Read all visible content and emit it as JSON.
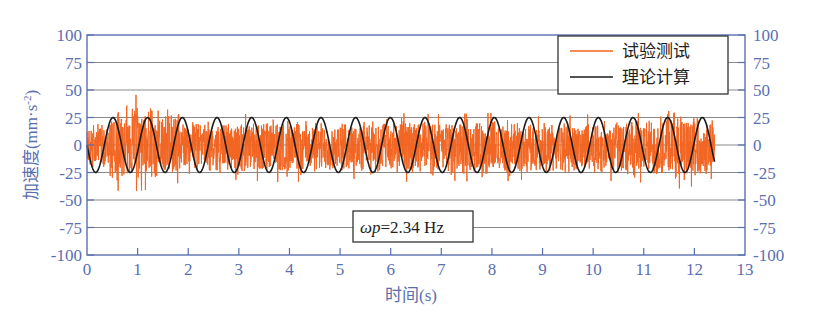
{
  "chart_data": {
    "type": "line",
    "title": "",
    "xlabel": "时间(s)",
    "ylabel": "加速度(mm·s⁻²)",
    "ylabel_parts": {
      "main": "加速度(mm·s",
      "sup": "-2",
      "close": ")"
    },
    "xlim": [
      0,
      13
    ],
    "ylim": [
      -100,
      100
    ],
    "x_ticks": [
      0,
      1,
      2,
      3,
      4,
      5,
      6,
      7,
      8,
      9,
      10,
      11,
      12,
      13
    ],
    "y_ticks": [
      100,
      75,
      50,
      25,
      0,
      -25,
      -50,
      -75,
      -100
    ],
    "y_ticks_right": [
      100,
      75,
      50,
      25,
      0,
      -25,
      -50,
      -75,
      -100
    ],
    "grid": {
      "horizontal": true,
      "vertical": false
    },
    "legend": {
      "position": "upper-right",
      "entries": [
        {
          "label": "试验测试",
          "color": "#f26522"
        },
        {
          "label": "理论计算",
          "color": "#1a1a1a"
        }
      ]
    },
    "annotation": {
      "prefix": "ωp",
      "text": "=2.34 Hz"
    },
    "series": [
      {
        "name": "试验测试",
        "color": "#f26522",
        "kind": "noisy-measured",
        "t_start": 0,
        "t_end": 12.4,
        "envelope": {
          "t": [
            0,
            0.3,
            0.6,
            1.0,
            1.5,
            1.8,
            2.2,
            3.0,
            4.0,
            5.0,
            6.0,
            7.0,
            8.0,
            9.0,
            10.0,
            11.0,
            11.8,
            12.4
          ],
          "upper": [
            18,
            22,
            38,
            40,
            35,
            30,
            22,
            24,
            25,
            22,
            25,
            24,
            25,
            22,
            24,
            25,
            35,
            24
          ],
          "lower": [
            -22,
            -26,
            -36,
            -36,
            -34,
            -30,
            -24,
            -28,
            -30,
            -26,
            -30,
            -28,
            -30,
            -26,
            -28,
            -30,
            -35,
            -26
          ]
        }
      },
      {
        "name": "理论计算",
        "color": "#1a1a1a",
        "kind": "sine",
        "amplitude": 25,
        "frequency_hz": 1.46,
        "phase_start": "zero-descending",
        "t_start": 0,
        "t_end": 12.4
      }
    ]
  },
  "style": {
    "axis_color": "#5a6fb0",
    "grid_color": "#8a8a8a",
    "frame_color": "#5a6fb0"
  }
}
